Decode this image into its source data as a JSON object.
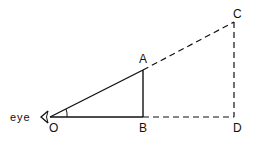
{
  "diagram": {
    "labels": {
      "eye": "eye",
      "O": "O",
      "A": "A",
      "B": "B",
      "C": "C",
      "D": "D"
    },
    "colors": {
      "stroke": "#111111",
      "background": "#ffffff"
    },
    "points": {
      "O": [
        50,
        117
      ],
      "A": [
        143,
        70
      ],
      "B": [
        143,
        117
      ],
      "C": [
        234,
        22
      ],
      "D": [
        234,
        117
      ]
    },
    "segments": {
      "solid": [
        "OA",
        "OB",
        "AB"
      ],
      "dashed": [
        "AC",
        "BD",
        "CD"
      ]
    }
  }
}
